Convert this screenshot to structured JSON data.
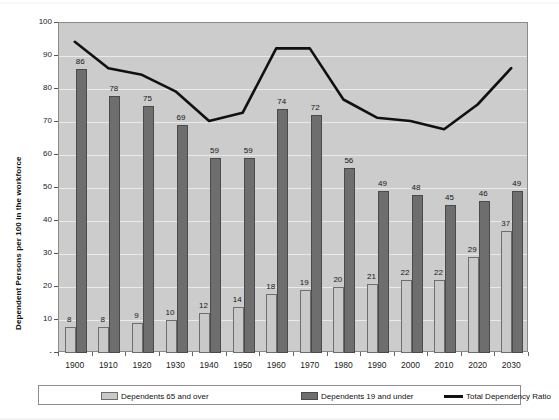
{
  "chart_data": {
    "type": "bar",
    "title": "",
    "subtitle": "",
    "xlabel": "",
    "ylabel": "Dependent Persons per 100 in the workforce",
    "ylim": [
      0,
      100
    ],
    "ytick_step": 10,
    "yticks": [
      0,
      10,
      20,
      30,
      40,
      50,
      60,
      70,
      80,
      90,
      100
    ],
    "ytick_labels": [
      "",
      "10",
      "20",
      "30",
      "40",
      "50",
      "60",
      "70",
      "80",
      "90",
      "100"
    ],
    "grid": "horizontal",
    "legend_position": "bottom",
    "categories": [
      "1900",
      "1910",
      "1920",
      "1930",
      "1940",
      "1950",
      "1960",
      "1970",
      "1980",
      "1990",
      "2000",
      "2010",
      "2020",
      "2030"
    ],
    "series": [
      {
        "name": "Dependents 65 and over",
        "type": "bar",
        "color": "#c9c9c9",
        "values": [
          8,
          8,
          9,
          10,
          12,
          14,
          18,
          19,
          20,
          21,
          22,
          22,
          29,
          37
        ],
        "labels": [
          "8",
          "8",
          "9",
          "10",
          "12",
          "14",
          "18",
          "19",
          "20",
          "21",
          "22",
          "22",
          "29",
          "37"
        ]
      },
      {
        "name": "Dependents 19 and under",
        "type": "bar",
        "color": "#6e6e6e",
        "values": [
          86,
          78,
          75,
          69,
          59,
          59,
          74,
          72,
          56,
          49,
          48,
          45,
          46,
          49
        ],
        "labels": [
          "86",
          "78",
          "75",
          "69",
          "59",
          "59",
          "74",
          "72",
          "56",
          "49",
          "48",
          "45",
          "46",
          "49"
        ]
      },
      {
        "name": "Total Dependency Ratio",
        "type": "line",
        "color": "#111111",
        "values": [
          94,
          86,
          84,
          79,
          70,
          72.5,
          92,
          92,
          76.5,
          71,
          70,
          67.5,
          75,
          86
        ],
        "labels": []
      }
    ]
  },
  "legend": {
    "items": [
      {
        "label": "Dependents 65 and over",
        "swatch": "light-bar-swatch"
      },
      {
        "label": "Dependents 19 and under",
        "swatch": "dark-bar-swatch"
      },
      {
        "label": "Total Dependency Ratio",
        "swatch": "black-line-swatch"
      }
    ]
  }
}
